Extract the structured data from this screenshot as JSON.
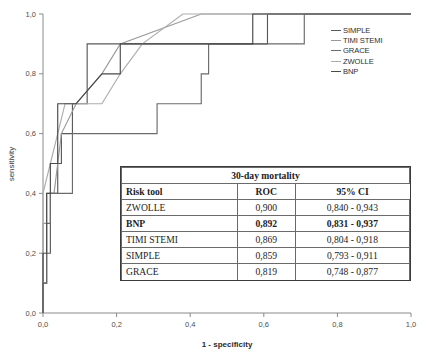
{
  "chart_data": {
    "type": "line",
    "title": "",
    "xlabel": "1 - specificity",
    "ylabel": "sensitivity",
    "xlim": [
      0.0,
      1.0
    ],
    "ylim": [
      0.0,
      1.0
    ],
    "xticks": [
      "0,0",
      "0,2",
      "0,4",
      "0,6",
      "0,8",
      "1,0"
    ],
    "xtick_values": [
      0.0,
      0.2,
      0.4,
      0.6,
      0.8,
      1.0
    ],
    "yticks": [
      "0,0",
      "0,2",
      "0,4",
      "0,6",
      "0,8",
      "1,0"
    ],
    "ytick_values": [
      0.0,
      0.2,
      0.4,
      0.6,
      0.8,
      1.0
    ],
    "grid": false,
    "legend_position": "top-right",
    "series": [
      {
        "name": "SIMPLE",
        "color": "#5a5a5a",
        "points": [
          [
            0.0,
            0.0
          ],
          [
            0.0,
            0.1
          ],
          [
            0.01,
            0.1
          ],
          [
            0.01,
            0.2
          ],
          [
            0.02,
            0.2
          ],
          [
            0.02,
            0.4
          ],
          [
            0.04,
            0.4
          ],
          [
            0.04,
            0.5
          ],
          [
            0.05,
            0.5
          ],
          [
            0.05,
            0.6
          ],
          [
            0.08,
            0.6
          ],
          [
            0.08,
            0.7
          ],
          [
            0.12,
            0.7
          ],
          [
            0.12,
            0.9
          ],
          [
            0.61,
            0.9
          ],
          [
            0.61,
            1.0
          ],
          [
            1.0,
            1.0
          ]
        ]
      },
      {
        "name": "TIMI STEMI",
        "color": "#9a9a9a",
        "points": [
          [
            0.0,
            0.0
          ],
          [
            0.0,
            0.3
          ],
          [
            0.01,
            0.3
          ],
          [
            0.01,
            0.4
          ],
          [
            0.03,
            0.4
          ],
          [
            0.05,
            0.6
          ],
          [
            0.09,
            0.7
          ],
          [
            0.16,
            0.8
          ],
          [
            0.21,
            0.9
          ],
          [
            0.43,
            1.0
          ],
          [
            1.0,
            1.0
          ]
        ]
      },
      {
        "name": "GRACE",
        "color": "#6b6b6b",
        "points": [
          [
            0.0,
            0.0
          ],
          [
            0.0,
            0.1
          ],
          [
            0.01,
            0.1
          ],
          [
            0.01,
            0.3
          ],
          [
            0.02,
            0.3
          ],
          [
            0.02,
            0.4
          ],
          [
            0.08,
            0.4
          ],
          [
            0.08,
            0.6
          ],
          [
            0.31,
            0.6
          ],
          [
            0.31,
            0.7
          ],
          [
            0.43,
            0.7
          ],
          [
            0.43,
            0.8
          ],
          [
            0.45,
            0.8
          ],
          [
            0.45,
            0.9
          ],
          [
            0.71,
            0.9
          ],
          [
            0.71,
            1.0
          ],
          [
            1.0,
            1.0
          ]
        ]
      },
      {
        "name": "ZWOLLE",
        "color": "#adadad",
        "points": [
          [
            0.0,
            0.0
          ],
          [
            0.0,
            0.4
          ],
          [
            0.02,
            0.5
          ],
          [
            0.04,
            0.6
          ],
          [
            0.06,
            0.7
          ],
          [
            0.16,
            0.7
          ],
          [
            0.21,
            0.8
          ],
          [
            0.27,
            0.9
          ],
          [
            0.38,
            1.0
          ],
          [
            1.0,
            1.0
          ]
        ]
      },
      {
        "name": "BNP",
        "color": "#4a4a4a",
        "points": [
          [
            0.0,
            0.0
          ],
          [
            0.0,
            0.2
          ],
          [
            0.01,
            0.2
          ],
          [
            0.01,
            0.4
          ],
          [
            0.02,
            0.4
          ],
          [
            0.02,
            0.5
          ],
          [
            0.04,
            0.5
          ],
          [
            0.04,
            0.7
          ],
          [
            0.09,
            0.7
          ],
          [
            0.16,
            0.8
          ],
          [
            0.21,
            0.8
          ],
          [
            0.21,
            0.9
          ],
          [
            0.57,
            0.9
          ],
          [
            0.57,
            1.0
          ],
          [
            1.0,
            1.0
          ]
        ]
      }
    ]
  },
  "legend": {
    "items": [
      {
        "label": "SIMPLE",
        "color": "#5a5a5a"
      },
      {
        "label": "TIMI STEMI",
        "color": "#9a9a9a"
      },
      {
        "label": "GRACE",
        "color": "#6b6b6b"
      },
      {
        "label": "ZWOLLE",
        "color": "#adadad"
      },
      {
        "label": "BNP",
        "color": "#4a4a4a"
      }
    ]
  },
  "table": {
    "title": "30-day mortality",
    "columns": [
      "Risk tool",
      "ROC",
      "95% CI"
    ],
    "rows": [
      {
        "tool": "ZWOLLE",
        "roc": "0,900",
        "ci": "0,840 - 0,943",
        "bold": false
      },
      {
        "tool": "BNP",
        "roc": "0,892",
        "ci": "0,831 - 0,937",
        "bold": true
      },
      {
        "tool": "TIMI STEMI",
        "roc": "0,869",
        "ci": "0,804 - 0,918",
        "bold": false
      },
      {
        "tool": "SIMPLE",
        "roc": "0,859",
        "ci": "0,793 - 0,911",
        "bold": false
      },
      {
        "tool": "GRACE",
        "roc": "0,819",
        "ci": "0,748 - 0,877",
        "bold": false
      }
    ]
  },
  "axes": {
    "x_title": "1 - specificity",
    "y_title": "sensitivity"
  }
}
